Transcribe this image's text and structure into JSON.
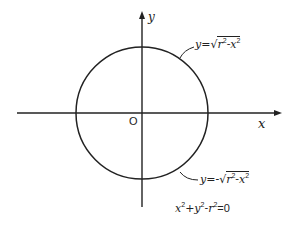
{
  "figure": {
    "type": "circle-on-axes",
    "circle": {
      "center": [
        142,
        113
      ],
      "radius": 66
    },
    "colors": {
      "stroke": "#222222",
      "background": "#ffffff"
    }
  },
  "axes": {
    "x_label": "x",
    "y_label": "y",
    "origin_label": "O"
  },
  "labels": {
    "upper_semicircle": {
      "lhs": "y=",
      "radicand_r": "r",
      "r_exp": "2",
      "minus": "-",
      "radicand_x": "x",
      "x_exp": "2"
    },
    "lower_semicircle": {
      "lhs": "y=-",
      "radicand_r": "r",
      "r_exp": "2",
      "minus": "-",
      "radicand_x": "x",
      "x_exp": "2"
    },
    "circle_equation": {
      "x": "x",
      "x_exp": "2",
      "plus": "+",
      "y": "y",
      "y_exp": "2",
      "minus": "-",
      "r": "r",
      "r_exp": "2",
      "rhs": "=0"
    }
  }
}
